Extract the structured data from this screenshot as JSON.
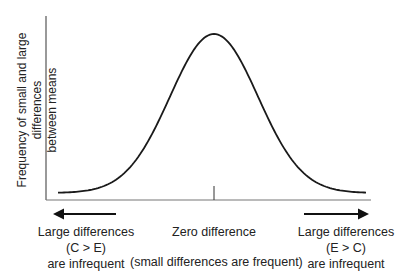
{
  "chart_data": {
    "type": "line",
    "title": "",
    "xlabel": "",
    "ylabel": "Frequency of small and large differences between means",
    "curve": "normal",
    "peak_x": "Zero difference",
    "grid": false,
    "legend": null,
    "annotations": {
      "left": [
        "Large differences",
        "(C > E)",
        "are infrequent"
      ],
      "center": [
        "Zero difference",
        "(small differences are frequent)"
      ],
      "right": [
        "Large differences",
        "(E > C)",
        "are infrequent"
      ]
    }
  },
  "ylabel": {
    "line1": "Frequency of small and large differences",
    "line2": "between means"
  },
  "left_label": {
    "line1": "Large differences",
    "line2": "(C > E)",
    "line3": "are infrequent"
  },
  "center_label": {
    "line1": "Zero difference",
    "line2": "(small differences are frequent)"
  },
  "right_label": {
    "line1": "Large differences",
    "line2": "(E > C)",
    "line3": "are infrequent"
  },
  "colors": {
    "curve": "#1a1a1a",
    "axis": "#555555",
    "text": "#222222"
  }
}
